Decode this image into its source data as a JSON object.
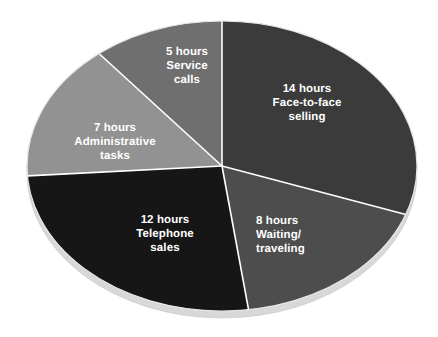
{
  "chart_data": {
    "type": "pie",
    "title": "",
    "subtitle": "",
    "xlabel": "",
    "ylabel": "",
    "units": "hours",
    "total": 46,
    "legend_position": "none",
    "grid": false,
    "labels_inside_slices": true,
    "background_color": "#ffffff",
    "label_text_color": "#ffffff",
    "divider_color": "#ffffff",
    "rim_color": "#d8d8d8",
    "categories": [
      "Face-to-face selling",
      "Waiting/ traveling",
      "Telephone sales",
      "Administrative tasks",
      "Service calls"
    ],
    "values": [
      14,
      8,
      12,
      7,
      5
    ],
    "slices": [
      {
        "name": "face-to-face-selling",
        "value": 14,
        "value_label": "14 hours",
        "category_label": "Face-to-face\nselling",
        "full_label": "14 hours\nFace-to-face\nselling",
        "color": "#3b3b3b",
        "align": "center"
      },
      {
        "name": "waiting-traveling",
        "value": 8,
        "value_label": "8 hours",
        "category_label": "Waiting/\ntraveling",
        "full_label": "8 hours\nWaiting/\ntraveling",
        "color": "#4d4d4d",
        "align": "left"
      },
      {
        "name": "telephone-sales",
        "value": 12,
        "value_label": "12 hours",
        "category_label": "Telephone\nsales",
        "full_label": "12 hours\nTelephone\nsales",
        "color": "#161616",
        "align": "center"
      },
      {
        "name": "administrative-tasks",
        "value": 7,
        "value_label": "7 hours",
        "category_label": "Administrative\ntasks",
        "full_label": "7 hours\nAdministrative\ntasks",
        "color": "#929292",
        "align": "center"
      },
      {
        "name": "service-calls",
        "value": 5,
        "value_label": "5 hours",
        "category_label": "Service\ncalls",
        "full_label": "5 hours\nService\ncalls",
        "color": "#6f6f6f",
        "align": "center"
      }
    ]
  }
}
